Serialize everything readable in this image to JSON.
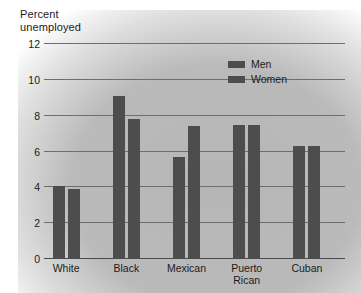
{
  "chart_data": {
    "type": "bar",
    "title": "",
    "ylabel": "Percent\nunemployed",
    "xlabel": "",
    "ylim": [
      0,
      12
    ],
    "yticks": [
      0,
      2,
      4,
      6,
      8,
      10,
      12
    ],
    "ytick_labels": [
      "0",
      "2",
      "4",
      "6",
      "8",
      "10",
      "12"
    ],
    "grid": true,
    "legend_position": "top-right",
    "categories": [
      "White",
      "Black",
      "Mexican",
      "Puerto\nRican",
      "Cuban"
    ],
    "series": [
      {
        "name": "Men",
        "color": "#4d4d4d",
        "values": [
          4.1,
          9.1,
          5.7,
          7.5,
          6.3
        ]
      },
      {
        "name": "Women",
        "color": "#4d4d4d",
        "values": [
          3.9,
          7.8,
          7.4,
          7.5,
          6.3
        ]
      }
    ]
  },
  "legend": {
    "items": [
      {
        "label": "Men"
      },
      {
        "label": "Women"
      }
    ]
  },
  "colors": {
    "bar": "#4d4d4d",
    "grid": "#6e6e6e",
    "axis": "#4a4a4a",
    "text": "#1b1b1b",
    "page": "#ffffff"
  }
}
